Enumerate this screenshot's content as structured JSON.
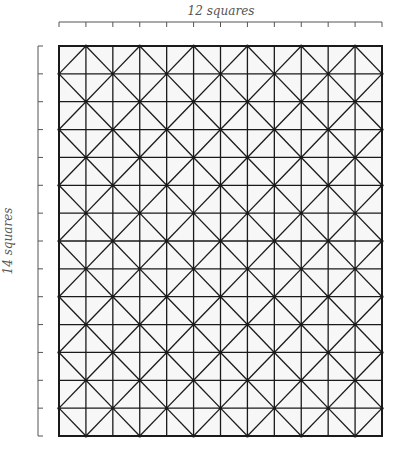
{
  "diagram": {
    "top_label": "12 squares",
    "side_label": "14 squares",
    "columns": 12,
    "rows": 14,
    "pattern": "square grid with diagonal diamond lattice",
    "colors": {
      "line": "#1a1a1a",
      "ruler": "#555555",
      "background": "#ffffff",
      "cell_fill": "#f7f7f7"
    },
    "caption": ""
  }
}
